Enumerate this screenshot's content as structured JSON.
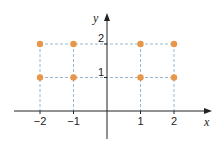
{
  "chart_data": {
    "type": "scatter",
    "title": "",
    "xlabel": "x",
    "ylabel": "y",
    "x_ticks": [
      "−2",
      "−1",
      "1",
      "2"
    ],
    "x_tick_values": [
      -2,
      -1,
      1,
      2
    ],
    "y_ticks": [
      "1",
      "2"
    ],
    "y_tick_values": [
      1,
      2
    ],
    "points": [
      {
        "x": -2,
        "y": 2
      },
      {
        "x": -1,
        "y": 2
      },
      {
        "x": 1,
        "y": 2
      },
      {
        "x": 2,
        "y": 2
      },
      {
        "x": -2,
        "y": 1
      },
      {
        "x": -1,
        "y": 1
      },
      {
        "x": 1,
        "y": 1
      },
      {
        "x": 2,
        "y": 1
      }
    ],
    "guides": "dashed projection lines from points to axes",
    "grid": false,
    "legend": null,
    "colors": {
      "points": "#e8974a",
      "guides": "#7fa3c4",
      "axes": "#222222"
    }
  }
}
